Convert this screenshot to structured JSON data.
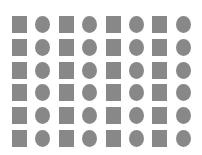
{
  "figure": {
    "rows": 6,
    "cols": 8,
    "pattern": [
      "square",
      "circle",
      "square",
      "circle",
      "square",
      "circle",
      "square",
      "circle"
    ],
    "shape_color": "#888888",
    "background_color": "#ffffff"
  }
}
